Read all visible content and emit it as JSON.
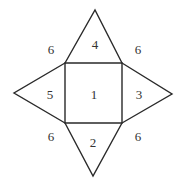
{
  "diagram": {
    "type": "square-pyramid-net",
    "colors": {
      "stroke": "#2a2a2a",
      "text": "#333333",
      "background": "#ffffff"
    },
    "square": {
      "corners": [
        [
          65,
          63
        ],
        [
          122,
          63
        ],
        [
          122,
          123
        ],
        [
          65,
          123
        ]
      ]
    },
    "triangles": {
      "top": {
        "apex": [
          95,
          10
        ]
      },
      "left": {
        "apex": [
          14,
          93
        ]
      },
      "right": {
        "apex": [
          172,
          94
        ]
      },
      "bottom": {
        "apex": [
          93,
          176
        ]
      }
    },
    "face_labels": {
      "center": "1",
      "bottom": "2",
      "right": "3",
      "top": "4",
      "left": "5"
    },
    "edge_labels": {
      "top_left": "6",
      "top_right": "6",
      "bottom_left": "6",
      "bottom_right": "6"
    }
  }
}
